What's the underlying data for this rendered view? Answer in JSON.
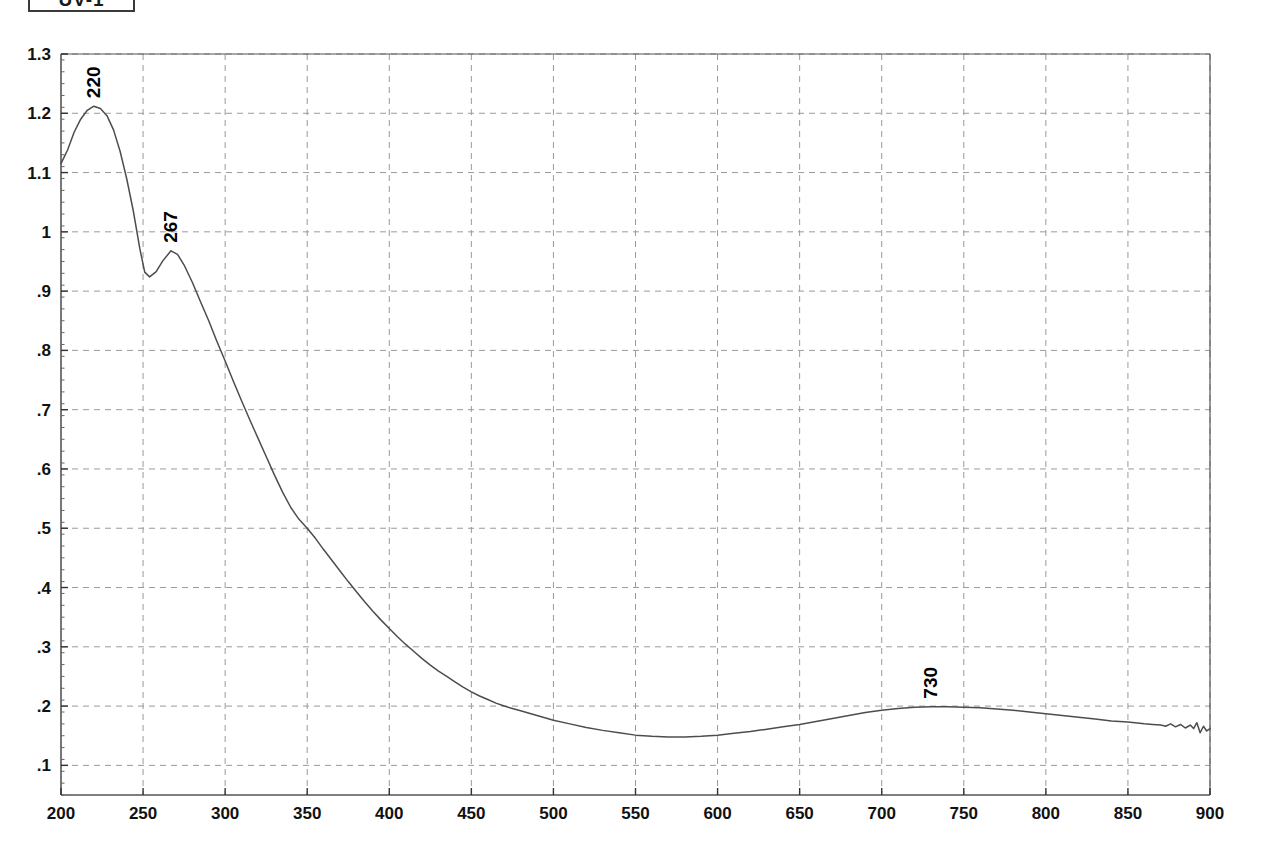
{
  "header": {
    "box_label": "UV-1"
  },
  "chart_data": {
    "type": "line",
    "title": "",
    "subtitle": "",
    "xlabel": "",
    "ylabel": "",
    "xlim": [
      200,
      900
    ],
    "ylim": [
      0.05,
      1.3
    ],
    "grid": true,
    "legend": false,
    "x_ticks": [
      200,
      250,
      300,
      350,
      400,
      450,
      500,
      550,
      600,
      650,
      700,
      750,
      800,
      850,
      900
    ],
    "x_tick_labels": [
      "200",
      "250",
      "300",
      "350",
      "400",
      "450",
      "500",
      "550",
      "600",
      "650",
      "700",
      "750",
      "800",
      "850",
      "900"
    ],
    "y_ticks": [
      0.1,
      0.2,
      0.3,
      0.4,
      0.5,
      0.6,
      0.7,
      0.8,
      0.9,
      1.0,
      1.1,
      1.2,
      1.3
    ],
    "y_tick_labels": [
      ".1",
      ".2",
      ".3",
      ".4",
      ".5",
      ".6",
      ".7",
      ".8",
      ".9",
      "1",
      "1.1",
      "1.2",
      "1.3"
    ],
    "line_color": "#4d4d4d",
    "grid_color": "#9a9a9a",
    "axis_color": "#555555",
    "annotations": [
      {
        "label": "220",
        "x": 220,
        "y": 1.212,
        "rotation": -90
      },
      {
        "label": "267",
        "x": 267,
        "y": 0.968,
        "rotation": -90
      },
      {
        "label": "730",
        "x": 730,
        "y": 0.199,
        "rotation": -90
      }
    ],
    "series": [
      {
        "name": "absorbance",
        "x": [
          200,
          204,
          208,
          212,
          216,
          220,
          224,
          228,
          232,
          236,
          240,
          244,
          248,
          251,
          254,
          258,
          262,
          267,
          271,
          275,
          280,
          285,
          290,
          295,
          300,
          305,
          310,
          315,
          320,
          325,
          330,
          335,
          340,
          345,
          350,
          355,
          360,
          365,
          370,
          375,
          380,
          385,
          390,
          395,
          400,
          405,
          410,
          415,
          420,
          425,
          430,
          435,
          440,
          445,
          450,
          455,
          460,
          465,
          470,
          475,
          480,
          490,
          500,
          510,
          520,
          530,
          540,
          550,
          560,
          570,
          580,
          590,
          600,
          610,
          620,
          630,
          640,
          650,
          660,
          670,
          680,
          690,
          700,
          710,
          720,
          730,
          740,
          750,
          760,
          770,
          780,
          790,
          800,
          810,
          820,
          830,
          840,
          850,
          860,
          865,
          870,
          873,
          876,
          879,
          882,
          885,
          888,
          890,
          892,
          894,
          896,
          898,
          900
        ],
        "y": [
          1.115,
          1.138,
          1.168,
          1.19,
          1.205,
          1.212,
          1.208,
          1.196,
          1.172,
          1.136,
          1.09,
          1.036,
          0.972,
          0.932,
          0.924,
          0.933,
          0.951,
          0.968,
          0.962,
          0.944,
          0.915,
          0.882,
          0.85,
          0.815,
          0.782,
          0.748,
          0.715,
          0.683,
          0.652,
          0.621,
          0.59,
          0.561,
          0.535,
          0.515,
          0.5,
          0.483,
          0.464,
          0.446,
          0.428,
          0.41,
          0.393,
          0.376,
          0.36,
          0.345,
          0.331,
          0.317,
          0.304,
          0.292,
          0.28,
          0.269,
          0.259,
          0.25,
          0.241,
          0.232,
          0.224,
          0.217,
          0.211,
          0.205,
          0.2,
          0.196,
          0.192,
          0.184,
          0.176,
          0.17,
          0.164,
          0.159,
          0.155,
          0.151,
          0.149,
          0.148,
          0.148,
          0.149,
          0.151,
          0.154,
          0.157,
          0.161,
          0.165,
          0.169,
          0.174,
          0.179,
          0.184,
          0.189,
          0.193,
          0.196,
          0.198,
          0.199,
          0.199,
          0.198,
          0.197,
          0.195,
          0.193,
          0.19,
          0.187,
          0.184,
          0.181,
          0.178,
          0.175,
          0.173,
          0.17,
          0.169,
          0.168,
          0.166,
          0.17,
          0.165,
          0.169,
          0.163,
          0.168,
          0.162,
          0.172,
          0.155,
          0.166,
          0.158,
          0.162
        ]
      }
    ]
  }
}
